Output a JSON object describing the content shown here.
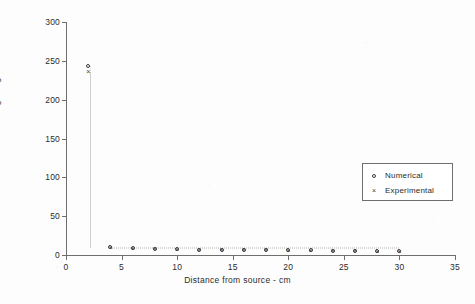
{
  "chart_data": {
    "type": "scatter",
    "title": "",
    "xlabel": "Distance from source  -  cm",
    "ylabel": "Sorbed concentration  -  mg/100gm",
    "xlim": [
      0,
      35
    ],
    "ylim": [
      0,
      300
    ],
    "xticks": [
      0,
      5,
      10,
      15,
      20,
      25,
      30,
      35
    ],
    "yticks": [
      0,
      50,
      100,
      150,
      200,
      250,
      300
    ],
    "grid": false,
    "legend_position": "center-right",
    "series": [
      {
        "name": "Numerical",
        "marker": "circle",
        "x": [
          2,
          4,
          6,
          8,
          10,
          12,
          14,
          16,
          18,
          20,
          22,
          24,
          26,
          28,
          30
        ],
        "values": [
          243,
          10,
          9,
          8,
          8,
          7,
          7,
          7,
          6,
          6,
          6,
          5,
          5,
          5,
          5
        ]
      },
      {
        "name": "Experimental",
        "marker": "x",
        "x": [
          2,
          4,
          6,
          8,
          10,
          12,
          14,
          16,
          18,
          20,
          22,
          24,
          26,
          28,
          30
        ],
        "values": [
          235,
          9,
          8,
          8,
          7,
          7,
          6,
          6,
          6,
          5,
          5,
          5,
          5,
          4,
          4
        ]
      }
    ]
  },
  "legend": {
    "entries": [
      {
        "label": "Numerical",
        "symbol": "circle"
      },
      {
        "label": "Experimental",
        "symbol": "x"
      }
    ]
  },
  "colors": {
    "axis": "#6e6e6e",
    "marker": "#3a3a3a",
    "text": "#2b2b2b",
    "background": "#fdfdfd"
  }
}
